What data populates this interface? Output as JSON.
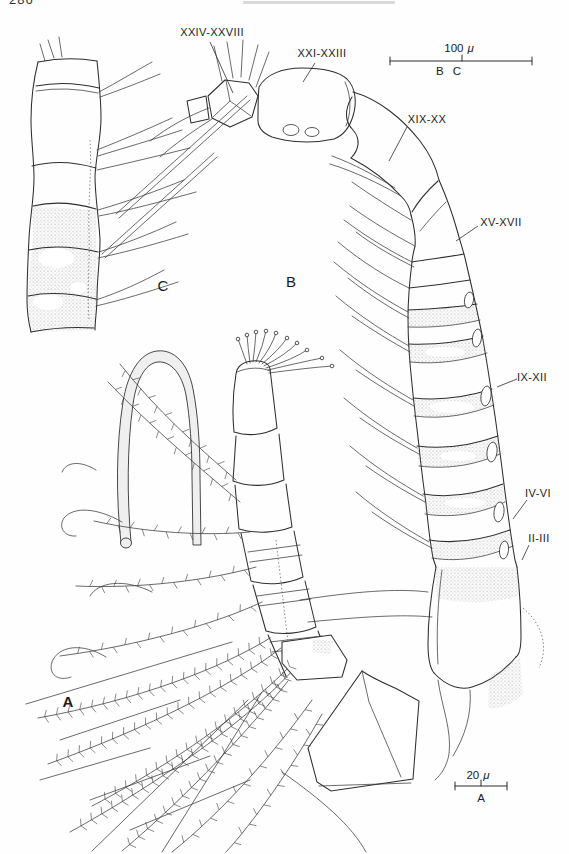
{
  "page": {
    "number": "286"
  },
  "figure": {
    "panels": [
      {
        "letter": "A"
      },
      {
        "letter": "B"
      },
      {
        "letter": "C"
      }
    ],
    "segment_labels": [
      {
        "id": "xxiv-xxviii",
        "text": "XXIV-XXVIII"
      },
      {
        "id": "xxi-xxiii",
        "text": "XXI-XXIII"
      },
      {
        "id": "xix-xx",
        "text": "XIX-XX"
      },
      {
        "id": "xv-xvii",
        "text": "XV-XVII"
      },
      {
        "id": "ix-xii",
        "text": "IX-XII"
      },
      {
        "id": "iv-vi",
        "text": "IV-VI"
      },
      {
        "id": "ii-iii",
        "text": "II-III"
      }
    ],
    "scale_bars": [
      {
        "id": "bc",
        "value": "100",
        "unit": "μ",
        "applies_to": "B C"
      },
      {
        "id": "a",
        "value": "20",
        "unit": "μ",
        "applies_to": "A"
      }
    ]
  }
}
